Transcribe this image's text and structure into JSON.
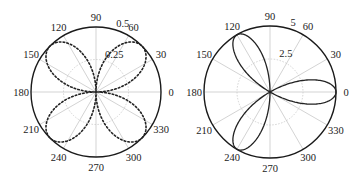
{
  "chart_data": [
    {
      "type": "line",
      "subtype": "polar",
      "title": "",
      "curve": "r = 0.5*|sin(2θ)| (four-petal rose)",
      "line_style": "dotted",
      "center": [
        96,
        92
      ],
      "radius_px": 65,
      "rmax": 0.5,
      "r_ticks": [
        {
          "value": 0.25,
          "label": "0.25"
        },
        {
          "value": 0.5,
          "label": "0.5"
        }
      ],
      "r_tick_angle_deg": 70,
      "theta_ticks": [
        {
          "deg": 0,
          "label": "0"
        },
        {
          "deg": 30,
          "label": "30"
        },
        {
          "deg": 60,
          "label": "60"
        },
        {
          "deg": 90,
          "label": "90"
        },
        {
          "deg": 120,
          "label": "120"
        },
        {
          "deg": 150,
          "label": "150"
        },
        {
          "deg": 180,
          "label": "180"
        },
        {
          "deg": 210,
          "label": "210"
        },
        {
          "deg": 240,
          "label": "240"
        },
        {
          "deg": 270,
          "label": "270"
        },
        {
          "deg": 300,
          "label": "300"
        },
        {
          "deg": 330,
          "label": "330"
        }
      ],
      "petal_peaks_deg": [
        45,
        135,
        225,
        315
      ],
      "petal_peak_value": 0.5,
      "grid": true,
      "func": {
        "kind": "abs_sin",
        "amp": 0.5,
        "k": 2
      }
    },
    {
      "type": "line",
      "subtype": "polar",
      "title": "",
      "curve": "r = 5*cos(3θ) (three-petal rose)",
      "line_style": "solid",
      "center": [
        270,
        92
      ],
      "radius_px": 66,
      "rmax": 5,
      "r_ticks": [
        {
          "value": 2.5,
          "label": "2.5"
        },
        {
          "value": 5,
          "label": "5"
        }
      ],
      "r_tick_angle_deg": 70,
      "theta_ticks": [
        {
          "deg": 0,
          "label": "0"
        },
        {
          "deg": 30,
          "label": "30"
        },
        {
          "deg": 60,
          "label": "60"
        },
        {
          "deg": 90,
          "label": "90"
        },
        {
          "deg": 120,
          "label": "120"
        },
        {
          "deg": 150,
          "label": "150"
        },
        {
          "deg": 180,
          "label": "180"
        },
        {
          "deg": 210,
          "label": "210"
        },
        {
          "deg": 240,
          "label": "240"
        },
        {
          "deg": 270,
          "label": "270"
        },
        {
          "deg": 300,
          "label": "300"
        },
        {
          "deg": 330,
          "label": "330"
        }
      ],
      "petal_peaks_deg": [
        0,
        120,
        240
      ],
      "petal_peak_value": 5,
      "grid": true,
      "func": {
        "kind": "pos_cos",
        "amp": 5,
        "k": 3
      }
    }
  ]
}
